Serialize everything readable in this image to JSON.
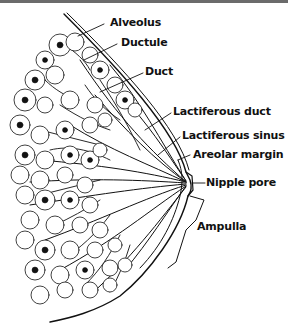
{
  "figure": {
    "labels": {
      "alveolus": "Alveolus",
      "ductule": "Ductule",
      "duct": "Duct",
      "lactiferous_duct": "Lactiferous duct",
      "lactiferous_sinus": "Lactiferous sinus",
      "areolar_margin": "Areolar margin",
      "nipple_pore": "Nipple pore",
      "ampulla": "Ampulla"
    },
    "colors": {
      "ink": "#111111",
      "background": "#ffffff",
      "top_bar": "#6b6b6b"
    }
  }
}
